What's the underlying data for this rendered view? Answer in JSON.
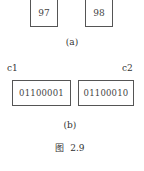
{
  "figure": {
    "part_a": {
      "boxes": [
        {
          "value": "97"
        },
        {
          "value": "98"
        }
      ],
      "caption": "(a)"
    },
    "part_b": {
      "boxes": [
        {
          "label": "c1",
          "value": "01100001"
        },
        {
          "label": "c2",
          "value": "01100010"
        }
      ],
      "caption": "(b)"
    },
    "title": "图  2.9"
  }
}
